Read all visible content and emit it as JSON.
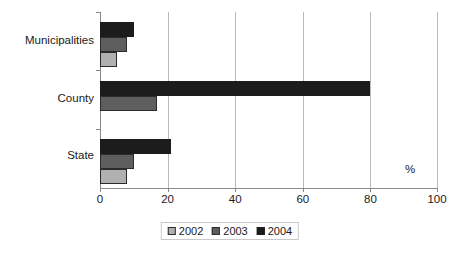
{
  "chart_data": {
    "type": "bar",
    "orientation": "horizontal",
    "title": "",
    "subtitle": "",
    "xlabel": "%",
    "ylabel": "",
    "xlim": [
      0,
      100
    ],
    "xticks": [
      0,
      20,
      40,
      60,
      80,
      100
    ],
    "xticklabels": [
      "0",
      "20",
      "40",
      "60",
      "80",
      "100"
    ],
    "grid": true,
    "grid_axis": "x",
    "legend_position": "bottom-center",
    "categories": [
      "Municipalities",
      "County",
      "State"
    ],
    "series": [
      {
        "name": "2002",
        "color": "#b0b0b0",
        "values": [
          5,
          0,
          8
        ]
      },
      {
        "name": "2003",
        "color": "#5e5e5e",
        "values": [
          8,
          17,
          10
        ]
      },
      {
        "name": "2004",
        "color": "#1c1c1c",
        "values": [
          10,
          80,
          21
        ]
      }
    ],
    "annotations": []
  },
  "axis": {
    "percent_symbol": "%",
    "tick_0": "0",
    "tick_20": "20",
    "tick_40": "40",
    "tick_60": "60",
    "tick_80": "80",
    "tick_100": "100"
  },
  "categories": {
    "municipalities": "Municipalities",
    "county": "County",
    "state": "State"
  },
  "legend": {
    "item_2002": "2002",
    "item_2003": "2003",
    "item_2004": "2004"
  }
}
